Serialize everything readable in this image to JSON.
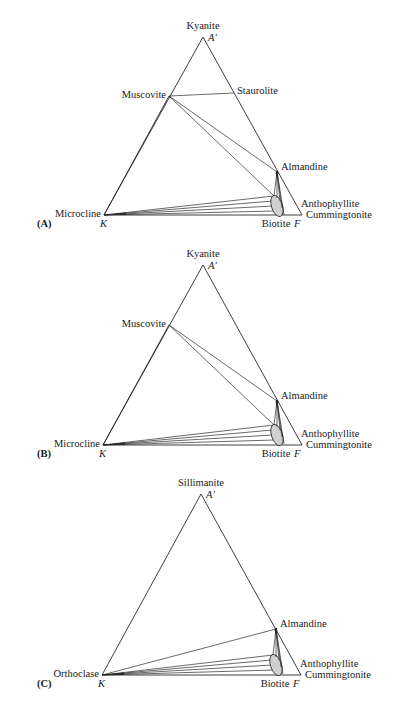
{
  "figure": {
    "panels": [
      {
        "id": "A",
        "panel_label": "(A)",
        "apex": {
          "mineral": "Kyanite",
          "corner": "A′",
          "x": 203,
          "y": 37
        },
        "left": {
          "mineral": "Microcline",
          "corner": "K",
          "x": 104,
          "y": 215
        },
        "right": {
          "corner": "F",
          "x": 302,
          "y": 215
        },
        "phases": {
          "muscovite": {
            "label": "Muscovite",
            "x": 169,
            "y": 96
          },
          "staurolite": {
            "label": "Staurolite",
            "x": 234,
            "y": 93
          },
          "almandine": {
            "label": "Almandine",
            "x": 277,
            "y": 172
          },
          "biotite": {
            "label": "Biotite",
            "cx": 277,
            "cy": 206,
            "rx": 5.5,
            "ry": 11
          },
          "anthophyllite": {
            "label": "Anthophyllite"
          },
          "cummingtonite": {
            "label": "Cummingtonite"
          }
        },
        "has_staurolite": true,
        "has_muscovite": true
      },
      {
        "id": "B",
        "panel_label": "(B)",
        "apex": {
          "mineral": "Kyanite",
          "corner": "A′",
          "x": 203,
          "y": 265
        },
        "left": {
          "mineral": "Microcline",
          "corner": "K",
          "x": 103,
          "y": 445
        },
        "right": {
          "corner": "F",
          "x": 302,
          "y": 445
        },
        "phases": {
          "muscovite": {
            "label": "Muscovite",
            "x": 169,
            "y": 325
          },
          "almandine": {
            "label": "Almandine",
            "x": 277,
            "y": 401
          },
          "biotite": {
            "label": "Biotite",
            "cx": 277,
            "cy": 435,
            "rx": 5.5,
            "ry": 11
          },
          "anthophyllite": {
            "label": "Anthophyllite"
          },
          "cummingtonite": {
            "label": "Cummingtonite"
          }
        },
        "has_staurolite": false,
        "has_muscovite": true
      },
      {
        "id": "C",
        "panel_label": "(C)",
        "apex": {
          "mineral": "Sillimanite",
          "corner": "A′",
          "x": 201,
          "y": 494
        },
        "left": {
          "mineral": "Orthoclase",
          "corner": "K",
          "x": 102,
          "y": 675
        },
        "right": {
          "corner": "F",
          "x": 301,
          "y": 675
        },
        "phases": {
          "almandine": {
            "label": "Almandine",
            "x": 276,
            "y": 629
          },
          "biotite": {
            "label": "Biotite",
            "cx": 276,
            "cy": 665,
            "rx": 5.5,
            "ry": 11
          },
          "anthophyllite": {
            "label": "Anthophyllite"
          },
          "cummingtonite": {
            "label": "Cummingtonite"
          }
        },
        "has_staurolite": false,
        "has_muscovite": false
      }
    ]
  },
  "colors": {
    "line": "#2a2a2a",
    "biotite_fill": "#d0d0d0",
    "background": "#ffffff"
  }
}
